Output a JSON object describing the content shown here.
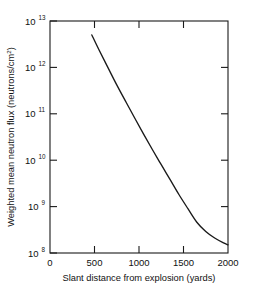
{
  "chart_data": {
    "type": "line",
    "title": "",
    "xlabel": "Slant distance from explosion (yards)",
    "ylabel": "Weighted mean neutron flux (neutrons/cm",
    "ylabel_superscript": "2",
    "ylabel_suffix": ")",
    "xlim": [
      0,
      2000
    ],
    "ylim": [
      100000000,
      10000000000000
    ],
    "yscale": "log",
    "xscale": "linear",
    "grid": false,
    "legend": null,
    "xticks": [
      0,
      500,
      1000,
      1500,
      2000
    ],
    "xtick_labels": [
      "0",
      "500",
      "1000",
      "1500",
      "2000"
    ],
    "yticks": [
      100000000,
      1000000000,
      10000000000,
      100000000000,
      1000000000000,
      10000000000000
    ],
    "ytick_labels": [
      "10",
      "10",
      "10",
      "10",
      "10",
      "10"
    ],
    "ytick_exponents": [
      "8",
      "9",
      "10",
      "11",
      "12",
      "13"
    ],
    "series": [
      {
        "name": "Weighted mean neutron flux",
        "color": "#1a1a1a",
        "x": [
          470,
          550,
          650,
          750,
          850,
          950,
          1050,
          1150,
          1250,
          1350,
          1450,
          1550,
          1650,
          1750,
          1850,
          1950,
          2000
        ],
        "y": [
          5000000000000.0,
          2400000000000.0,
          1000000000000.0,
          420000000000.0,
          185000000000.0,
          82000000000.0,
          37000000000.0,
          17000000000.0,
          8000000000.0,
          3800000000.0,
          1800000000.0,
          900000000.0,
          460000000.0,
          290000000.0,
          210000000.0,
          165000000.0,
          150000000.0
        ]
      }
    ],
    "axis_color": "#1a1a1a",
    "background_color": "#ffffff"
  }
}
